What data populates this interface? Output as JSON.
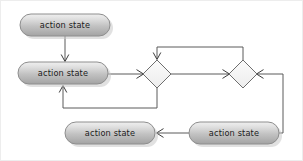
{
  "diagram": {
    "type": "uml-activity-diagram",
    "background_color": "#ffffff",
    "line_color": "#5a5a5a",
    "arrow_color": "#3d3d3d",
    "node_fill_top": "#ebebeb",
    "node_fill_bottom": "#a6a6a6",
    "node_border_color": "#8e8e8e",
    "text_color": "#1c1c1c",
    "nodes": [
      {
        "id": "state-top-left",
        "kind": "action-state",
        "label": "action state",
        "x": 20,
        "y": 14,
        "width": 90,
        "height": 22
      },
      {
        "id": "state-middle-left",
        "kind": "action-state",
        "label": "action state",
        "x": 18,
        "y": 62,
        "width": 90,
        "height": 22
      },
      {
        "id": "state-bottom-left",
        "kind": "action-state",
        "label": "action state",
        "x": 65,
        "y": 122,
        "width": 90,
        "height": 22
      },
      {
        "id": "state-bottom-right",
        "kind": "action-state",
        "label": "action state",
        "x": 189,
        "y": 122,
        "width": 90,
        "height": 22
      },
      {
        "id": "decision-left",
        "kind": "decision-node",
        "label": "",
        "cx": 157,
        "cy": 74,
        "rx": 14,
        "ry": 14
      },
      {
        "id": "decision-right",
        "kind": "decision-node",
        "label": "",
        "cx": 243,
        "cy": 74,
        "rx": 14,
        "ry": 14
      }
    ],
    "edges": [
      {
        "id": "edge-top-to-middle",
        "from": "state-top-left",
        "to": "state-middle-left",
        "label": "",
        "path": "M 65 36 L 65 61",
        "arrow_at": "65,61",
        "arrow_dir": "down"
      },
      {
        "id": "edge-middle-to-decision-left",
        "from": "state-middle-left",
        "to": "decision-left",
        "label": "",
        "path": "M 108 74 L 142 74",
        "arrow_at": "142,74",
        "arrow_dir": "right"
      },
      {
        "id": "edge-decision-left-to-decision-right",
        "from": "decision-left",
        "to": "decision-right",
        "label": "",
        "path": "M 171 74 L 228 74",
        "arrow_at": "228,74",
        "arrow_dir": "right"
      },
      {
        "id": "edge-decision-right-top-to-decision-left-top",
        "from": "decision-right",
        "to": "decision-left",
        "label": "",
        "path": "M 243 60 L 243 47 L 157 47 L 157 59",
        "arrow_at": "157,59",
        "arrow_dir": "down"
      },
      {
        "id": "edge-decision-left-bottom-to-middle-state",
        "from": "decision-left",
        "to": "state-middle-left",
        "label": "",
        "path": "M 157 88 L 157 108 L 63 108 L 63 86",
        "arrow_at": "63,86",
        "arrow_dir": "up"
      },
      {
        "id": "edge-bottom-right-to-decision-right",
        "from": "state-bottom-right",
        "to": "decision-right",
        "label": "",
        "path": "M 279 133 L 283 133 L 283 74 L 258 74",
        "arrow_at": "258,74",
        "arrow_dir": "left"
      },
      {
        "id": "edge-bottom-right-to-bottom-left",
        "from": "state-bottom-right",
        "to": "state-bottom-left",
        "label": "",
        "path": "M 189 133 L 158 133",
        "arrow_at": "158,133",
        "arrow_dir": "left"
      }
    ]
  }
}
